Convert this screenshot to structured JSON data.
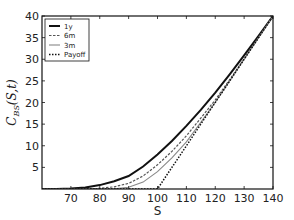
{
  "chart_data": {
    "type": "line",
    "title": "",
    "xlabel": "S",
    "ylabel": "C_BS(S,t)",
    "xlim": [
      60,
      140
    ],
    "ylim": [
      0,
      40
    ],
    "xticks": [
      70,
      80,
      90,
      100,
      110,
      120,
      130,
      140
    ],
    "yticks": [
      5,
      10,
      15,
      20,
      25,
      30,
      35,
      40
    ],
    "grid": false,
    "legend_position": "upper left",
    "x": [
      60,
      65,
      70,
      75,
      80,
      85,
      90,
      95,
      100,
      105,
      110,
      115,
      120,
      125,
      130,
      135,
      140
    ],
    "series": [
      {
        "name": "1y",
        "style": "solid-thick",
        "color": "#111111",
        "values": [
          0.0,
          0.03,
          0.12,
          0.35,
          0.9,
          1.8,
          3.0,
          5.2,
          8.0,
          11.1,
          14.6,
          18.3,
          22.3,
          26.5,
          30.9,
          35.4,
          40.0
        ]
      },
      {
        "name": "6m",
        "style": "dashed",
        "color": "#555555",
        "values": [
          0.0,
          0.0,
          0.01,
          0.04,
          0.15,
          0.5,
          1.3,
          3.0,
          5.6,
          8.7,
          12.3,
          16.4,
          20.6,
          25.3,
          30.1,
          35.0,
          40.0
        ]
      },
      {
        "name": "3m",
        "style": "solid-thin",
        "color": "#888888",
        "values": [
          0.0,
          0.0,
          0.0,
          0.0,
          0.01,
          0.08,
          0.4,
          1.6,
          4.0,
          7.2,
          10.9,
          15.4,
          20.1,
          25.0,
          30.0,
          35.0,
          40.0
        ]
      },
      {
        "name": "Payoff",
        "style": "dotted",
        "color": "#111111",
        "values": [
          0,
          0,
          0,
          0,
          0,
          0,
          0,
          0,
          0,
          5,
          10,
          15,
          20,
          25,
          30,
          35,
          40
        ]
      }
    ]
  }
}
